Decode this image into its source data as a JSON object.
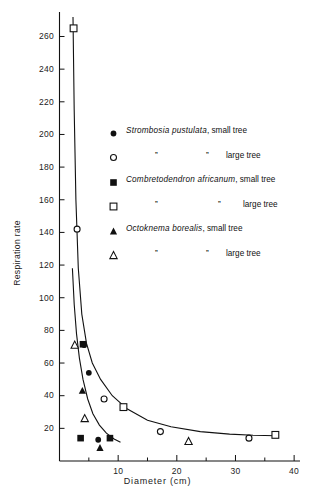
{
  "chart_data": {
    "type": "scatter",
    "title": "",
    "xlabel": "Diameter  (cm)",
    "ylabel": "Respiration rate",
    "xlim": [
      0,
      41
    ],
    "ylim": [
      0,
      275
    ],
    "xticks": [
      10,
      20,
      30,
      40
    ],
    "xtick_labels": [
      "10",
      "20",
      "30",
      "40"
    ],
    "xminor": [
      5,
      15,
      25,
      35
    ],
    "yticks": [
      20,
      40,
      60,
      80,
      100,
      120,
      140,
      160,
      180,
      200,
      220,
      240,
      260
    ],
    "ytick_labels": [
      "20",
      "40",
      "60",
      "80",
      "100",
      "120",
      "140",
      "160",
      "180",
      "200",
      "220",
      "240",
      "260"
    ],
    "grid": false,
    "legend_position": "upper-right-inside",
    "series": [
      {
        "name": "Strombosia pustulata, small tree",
        "marker": "filled-circle",
        "points": [
          [
            4.2,
            71.0
          ],
          [
            5.0,
            54.0
          ],
          [
            6.6,
            13.0
          ]
        ]
      },
      {
        "name": "Strombosia pustulata, large tree",
        "marker": "open-circle",
        "points": [
          [
            3.0,
            142.0
          ],
          [
            7.6,
            38.0
          ],
          [
            17.2,
            18.0
          ],
          [
            32.3,
            14.0
          ]
        ]
      },
      {
        "name": "Combretodendron africanum, small tree",
        "marker": "filled-square",
        "points": [
          [
            4.0,
            71.5
          ],
          [
            3.6,
            14.0
          ],
          [
            8.6,
            14.0
          ]
        ]
      },
      {
        "name": "Combretodendron africanum, large tree",
        "marker": "open-square",
        "points": [
          [
            2.4,
            265.0
          ],
          [
            10.9,
            33.0
          ],
          [
            36.8,
            16.0
          ]
        ]
      },
      {
        "name": "Octoknema borealis, small tree",
        "marker": "filled-triangle",
        "points": [
          [
            3.9,
            43.0
          ],
          [
            6.9,
            8.0
          ]
        ]
      },
      {
        "name": "Octoknema borealis, large tree",
        "marker": "open-triangle",
        "points": [
          [
            2.6,
            71.0
          ],
          [
            4.3,
            26.0
          ],
          [
            22.0,
            12.0
          ]
        ]
      }
    ],
    "curves": [
      {
        "name": "upper-fitted-curve",
        "description": "hyperbolic decline through large-tree points",
        "points": [
          [
            2.3,
            272.0
          ],
          [
            2.5,
            215.0
          ],
          [
            2.8,
            160.0
          ],
          [
            3.2,
            118.0
          ],
          [
            3.8,
            90.0
          ],
          [
            4.6,
            72.0
          ],
          [
            5.6,
            60.0
          ],
          [
            7.0,
            50.0
          ],
          [
            9.0,
            40.0
          ],
          [
            11.5,
            32.0
          ],
          [
            15.0,
            25.0
          ],
          [
            19.0,
            21.0
          ],
          [
            24.0,
            18.0
          ],
          [
            29.0,
            16.5
          ],
          [
            33.0,
            15.8
          ],
          [
            37.0,
            15.5
          ]
        ]
      },
      {
        "name": "lower-fitted-curve",
        "description": "hyperbolic decline through small-tree points",
        "points": [
          [
            2.2,
            118.0
          ],
          [
            2.5,
            96.0
          ],
          [
            2.9,
            78.0
          ],
          [
            3.4,
            63.0
          ],
          [
            4.0,
            50.0
          ],
          [
            4.8,
            38.0
          ],
          [
            5.7,
            29.0
          ],
          [
            6.8,
            22.0
          ],
          [
            8.0,
            17.0
          ],
          [
            9.3,
            13.5
          ],
          [
            10.4,
            11.5
          ]
        ]
      }
    ]
  },
  "legend": {
    "rows": [
      {
        "marker": "filled-circle",
        "name": "Strombosia pustulata",
        "comma": ",",
        "tail": "small tree",
        "ditto": false
      },
      {
        "marker": "open-circle",
        "name": "",
        "comma": "",
        "tail": "large tree",
        "ditto": true,
        "ditto_mark": "”"
      },
      {
        "marker": "filled-square",
        "name": "Combretodendron africanum",
        "comma": ",",
        "tail": "small tree",
        "ditto": false
      },
      {
        "marker": "open-square",
        "name": "",
        "comma": "",
        "tail": "large tree",
        "ditto": true,
        "ditto_mark": "”"
      },
      {
        "marker": "filled-triangle",
        "name": "Octoknema borealis",
        "comma": ",",
        "tail": "small tree",
        "ditto": false
      },
      {
        "marker": "open-triangle",
        "name": "",
        "comma": "",
        "tail": "large tree",
        "ditto": true,
        "ditto_mark": "”"
      }
    ]
  },
  "axis": {
    "x_title": "Diameter  (cm)",
    "y_title": "Respiration rate"
  },
  "colors": {
    "ink": "#111111",
    "background": "#ffffff"
  }
}
